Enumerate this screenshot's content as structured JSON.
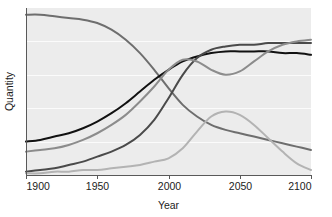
{
  "chart_data": {
    "type": "line",
    "title": "",
    "xlabel": "Year",
    "ylabel": "Quantity",
    "xlim": [
      1900,
      2100
    ],
    "ylim": [
      0,
      100
    ],
    "xticks": [
      1900,
      1950,
      2000,
      2050,
      2100
    ],
    "xticklabels": [
      "1900",
      "1950",
      "2000",
      "2050",
      "2100"
    ],
    "yticks": [],
    "yticklabels": [],
    "grid": true,
    "grid_orientation": "horizontal",
    "gridline_values": [
      20,
      40,
      60,
      80
    ],
    "legend": "none",
    "plot_background": "#ececec",
    "page_background": "#ffffff",
    "axis_color": "#595959",
    "gridline_color": "#fbfbfb",
    "x": [
      1900,
      1910,
      1920,
      1930,
      1940,
      1950,
      1960,
      1970,
      1980,
      1990,
      2000,
      2010,
      2020,
      2030,
      2040,
      2050,
      2060,
      2070,
      2080,
      2090,
      2100
    ],
    "series": [
      {
        "name": "series-1",
        "color": "#6e6e6e",
        "values": [
          96,
          96,
          95,
          94,
          93,
          91,
          87,
          81,
          73,
          63,
          52,
          42,
          35,
          30,
          27,
          25,
          23,
          21,
          19,
          17,
          15
        ]
      },
      {
        "name": "series-2",
        "color": "#111111",
        "values": [
          20,
          21,
          23,
          25,
          28,
          32,
          37,
          43,
          50,
          57,
          63,
          68,
          71,
          73,
          74,
          74,
          74,
          74,
          73,
          73,
          72
        ]
      },
      {
        "name": "series-3",
        "color": "#4a4a4a",
        "values": [
          2,
          3,
          4,
          6,
          8,
          11,
          14,
          18,
          24,
          33,
          46,
          60,
          70,
          75,
          77,
          78,
          78,
          79,
          79,
          79,
          79
        ]
      },
      {
        "name": "series-4",
        "color": "#8c8c8c",
        "values": [
          14,
          15,
          16,
          18,
          21,
          25,
          30,
          36,
          44,
          53,
          63,
          69,
          68,
          63,
          60,
          62,
          68,
          74,
          78,
          80,
          81
        ]
      },
      {
        "name": "series-5",
        "color": "#b3b3b3",
        "values": [
          1,
          1,
          2,
          2,
          3,
          3,
          4,
          5,
          6,
          8,
          10,
          16,
          26,
          35,
          38,
          36,
          30,
          22,
          14,
          7,
          3
        ]
      }
    ]
  }
}
